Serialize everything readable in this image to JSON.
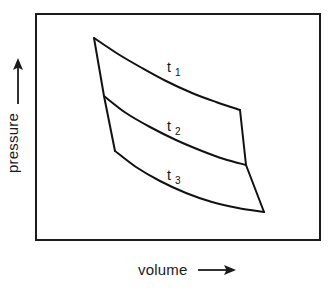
{
  "figure": {
    "kind": "pressure-volume isotherm diagram",
    "background_color": "#ffffff",
    "line_color": "#121212",
    "frame_color": "#1b1b1b"
  },
  "axes": {
    "x_label": "volume",
    "x_arrow": "right-arrow",
    "y_label": "pressure",
    "y_arrow": "up-arrow"
  },
  "curves": [
    {
      "id": "t1",
      "label": "t",
      "subscript": "1"
    },
    {
      "id": "t2",
      "label": "t",
      "subscript": "2"
    },
    {
      "id": "t3",
      "label": "t",
      "subscript": "3"
    }
  ],
  "chart_data": {
    "type": "line",
    "title": "",
    "xlabel": "volume",
    "ylabel": "pressure",
    "grid": false,
    "legend": "inline-curve-labels",
    "axis_ticks": false,
    "plot_frame": {
      "x0": 36,
      "y0": 14,
      "x1": 320,
      "y1": 240
    },
    "series": [
      {
        "name": "t1",
        "label": "t₁",
        "points": [
          [
            94,
            38
          ],
          [
            118,
            54
          ],
          [
            142,
            68
          ],
          [
            166,
            81
          ],
          [
            192,
            93
          ],
          [
            216,
            102
          ],
          [
            240,
            110
          ]
        ]
      },
      {
        "name": "t2",
        "label": "t₂",
        "points": [
          [
            104,
            96
          ],
          [
            126,
            113
          ],
          [
            150,
            127
          ],
          [
            176,
            140
          ],
          [
            202,
            151
          ],
          [
            224,
            159
          ],
          [
            246,
            165
          ]
        ]
      },
      {
        "name": "t3",
        "label": "t₃",
        "points": [
          [
            115,
            151
          ],
          [
            136,
            167
          ],
          [
            160,
            181
          ],
          [
            186,
            193
          ],
          [
            212,
            202
          ],
          [
            238,
            208
          ],
          [
            264,
            212
          ]
        ]
      }
    ],
    "connectors": [
      {
        "name": "left-boundary",
        "points": [
          [
            94,
            38
          ],
          [
            104,
            96
          ],
          [
            115,
            151
          ]
        ]
      },
      {
        "name": "right-boundary",
        "points": [
          [
            240,
            110
          ],
          [
            246,
            165
          ],
          [
            264,
            212
          ]
        ]
      }
    ]
  }
}
